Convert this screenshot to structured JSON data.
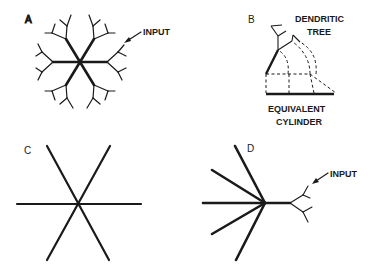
{
  "figure": {
    "panels": [
      {
        "id": "A",
        "label": "A",
        "description": "Branched dendritic tree with six primary trunks",
        "annotations": [
          {
            "text": "INPUT"
          }
        ]
      },
      {
        "id": "B",
        "label": "B",
        "description": "Dendritic tree collapsed into equivalent cylinder",
        "annotations": [
          {
            "text": "DENDRITIC"
          },
          {
            "text": "TREE"
          },
          {
            "text": "EQUIVALENT"
          },
          {
            "text": "CYLINDER"
          }
        ]
      },
      {
        "id": "C",
        "label": "C",
        "description": "Six equivalent cylinders radiating from soma"
      },
      {
        "id": "D",
        "label": "D",
        "description": "Five cylinders plus one branched dendrite receiving input",
        "annotations": [
          {
            "text": "INPUT"
          }
        ]
      }
    ],
    "colors": {
      "ink": "#1a1a1a",
      "background": "#ffffff"
    }
  }
}
